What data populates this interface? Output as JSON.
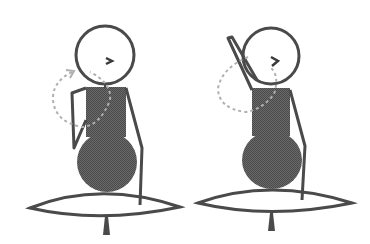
{
  "illustration": {
    "description": "Two seated stick figures on cushions demonstrating a shoulder/arm rotation exercise",
    "colors": {
      "line": "#4a4a4a",
      "fill_dark": "#5a5a5a",
      "fill_light": "#ffffff",
      "arc": "#b0b0b0",
      "background": "#ffffff"
    },
    "figures": [
      {
        "id": "left",
        "pose": "arm bent down at side, dashed arc showing rotation upward"
      },
      {
        "id": "right",
        "pose": "arm raised overhead, dashed arc showing rotation"
      }
    ]
  }
}
